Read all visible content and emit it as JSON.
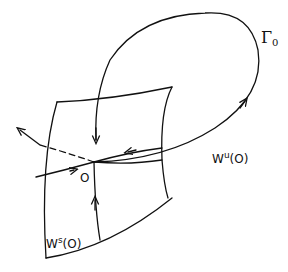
{
  "diagram": {
    "type": "dynamical-systems-manifold-sketch",
    "labels": {
      "orbit": {
        "base": "Γ",
        "subscript": "0"
      },
      "unstable_manifold": {
        "base": "W",
        "superscript": "u",
        "arg": "(O)"
      },
      "stable_manifold": {
        "base": "W",
        "superscript": "s",
        "arg": "(O)"
      },
      "fixed_point": "O"
    },
    "colors": {
      "stroke": "#111111",
      "background": "#ffffff"
    }
  }
}
